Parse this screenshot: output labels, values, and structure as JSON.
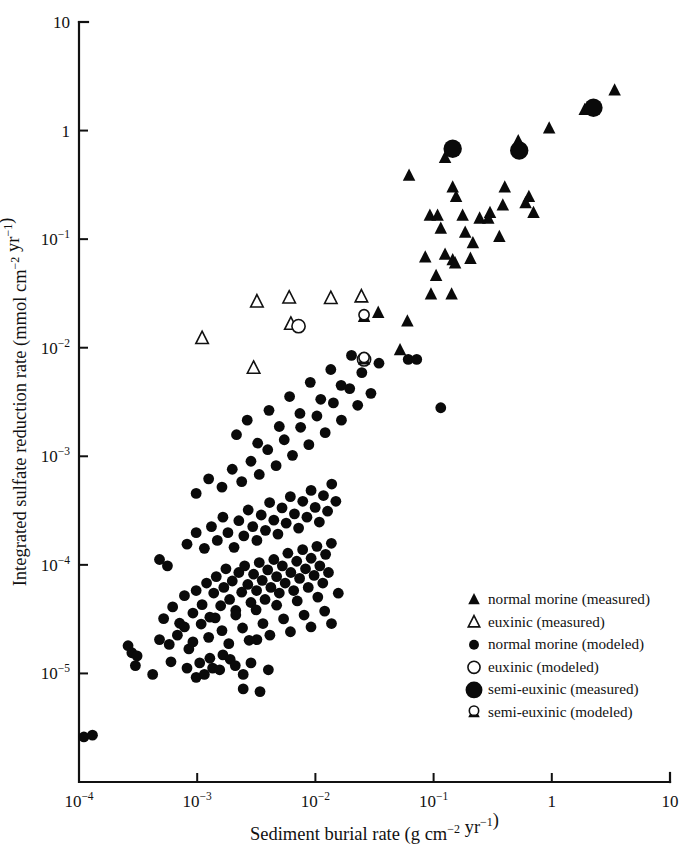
{
  "chart_data": {
    "type": "scatter",
    "title": "",
    "xlabel": "Sediment burial rate (g cm−2 yr−1)",
    "ylabel": "Integrated sulfate reduction rate (mmol cm−2 yr−1)",
    "xscale": "log",
    "yscale": "log",
    "xlim": [
      0.0001,
      10
    ],
    "ylim": [
      1e-06,
      10
    ],
    "grid": false,
    "legend_position": "inside-lower-right",
    "xticks": [
      {
        "value": 0.0001,
        "label": "10",
        "exp": "−4"
      },
      {
        "value": 0.001,
        "label": "10",
        "exp": "−3"
      },
      {
        "value": 0.01,
        "label": "10",
        "exp": "−2"
      },
      {
        "value": 0.1,
        "label": "10",
        "exp": "−1"
      },
      {
        "value": 1,
        "label": "1",
        "exp": ""
      },
      {
        "value": 10,
        "label": "10",
        "exp": ""
      }
    ],
    "yticks": [
      {
        "value": 10,
        "label": "10",
        "exp": ""
      },
      {
        "value": 1,
        "label": "1",
        "exp": ""
      },
      {
        "value": 0.1,
        "label": "10",
        "exp": "−1"
      },
      {
        "value": 0.01,
        "label": "10",
        "exp": "−2"
      },
      {
        "value": 0.001,
        "label": "10",
        "exp": "−3"
      },
      {
        "value": 0.0001,
        "label": "10",
        "exp": "−4"
      },
      {
        "value": 1e-05,
        "label": "10",
        "exp": "−5"
      }
    ],
    "series": [
      {
        "name": "normal morine (measured)",
        "marker": "filled-triangle",
        "color": "#0a0a0a",
        "points": [
          [
            0.062,
            0.385
          ],
          [
            0.125,
            0.56
          ],
          [
            0.145,
            0.3
          ],
          [
            0.155,
            0.245
          ],
          [
            0.093,
            0.165
          ],
          [
            0.108,
            0.165
          ],
          [
            0.115,
            0.125
          ],
          [
            0.176,
            0.165
          ],
          [
            0.185,
            0.115
          ],
          [
            0.215,
            0.092
          ],
          [
            0.3,
            0.175
          ],
          [
            0.36,
            0.105
          ],
          [
            0.385,
            0.205
          ],
          [
            0.4,
            0.3
          ],
          [
            0.52,
            0.8
          ],
          [
            0.6,
            0.215
          ],
          [
            0.64,
            0.245
          ],
          [
            0.7,
            0.175
          ],
          [
            0.95,
            1.05
          ],
          [
            1.9,
            1.55
          ],
          [
            3.4,
            2.35
          ],
          [
            0.085,
            0.068
          ],
          [
            0.105,
            0.046
          ],
          [
            0.145,
            0.064
          ],
          [
            0.152,
            0.06
          ],
          [
            0.205,
            0.066
          ],
          [
            0.095,
            0.031
          ],
          [
            0.142,
            0.031
          ],
          [
            0.06,
            0.0175
          ],
          [
            0.052,
            0.0095
          ],
          [
            0.034,
            0.021
          ],
          [
            0.125,
            0.072
          ],
          [
            0.245,
            0.155
          ],
          [
            0.29,
            0.155
          ]
        ]
      },
      {
        "name": "euxinic (measured)",
        "marker": "open-triangle",
        "color": "#ffffff",
        "points": [
          [
            0.0011,
            0.0122
          ],
          [
            0.003,
            0.0065
          ],
          [
            0.0032,
            0.0265
          ],
          [
            0.006,
            0.0288
          ],
          [
            0.0062,
            0.0165
          ],
          [
            0.0135,
            0.0285
          ],
          [
            0.0245,
            0.0295
          ]
        ]
      },
      {
        "name": "normal morine (modeled)",
        "marker": "filled-circle",
        "color": "#0a0a0a",
        "points": [
          [
            0.00011,
            2.6e-06
          ],
          [
            0.00013,
            2.7e-06
          ],
          [
            0.00026,
            1.8e-05
          ],
          [
            0.00028,
            1.55e-05
          ],
          [
            0.00031,
            1.45e-05
          ],
          [
            0.0003,
            1.18e-05
          ],
          [
            0.00048,
            2.05e-05
          ],
          [
            0.00042,
            9.8e-06
          ],
          [
            0.0006,
            1.28e-05
          ],
          [
            0.00085,
            1.68e-05
          ],
          [
            0.00082,
            1.12e-05
          ],
          [
            0.00105,
            1.25e-05
          ],
          [
            0.00098,
            9.2e-06
          ],
          [
            0.00115,
            9.8e-06
          ],
          [
            0.00128,
            1.38e-05
          ],
          [
            0.00135,
            1.12e-05
          ],
          [
            0.00155,
            1.08e-05
          ],
          [
            0.00165,
            1.48e-05
          ],
          [
            0.0019,
            1.35e-05
          ],
          [
            0.0021,
            1.18e-05
          ],
          [
            0.00245,
            9.8e-06
          ],
          [
            0.00285,
            1.25e-05
          ],
          [
            0.0032,
            2.05e-05
          ],
          [
            0.004,
            1.08e-05
          ],
          [
            0.00052,
            3.2e-05
          ],
          [
            0.00062,
            4.1e-05
          ],
          [
            0.00071,
            2.9e-05
          ],
          [
            0.00078,
            5.2e-05
          ],
          [
            0.00092,
            3.6e-05
          ],
          [
            0.00098,
            5.8e-05
          ],
          [
            0.0011,
            4.3e-05
          ],
          [
            0.0012,
            6.8e-05
          ],
          [
            0.00128,
            3.3e-05
          ],
          [
            0.00138,
            5.5e-05
          ],
          [
            0.00145,
            7.8e-05
          ],
          [
            0.00158,
            4.2e-05
          ],
          [
            0.00168,
            6.2e-05
          ],
          [
            0.00175,
            9.2e-05
          ],
          [
            0.00188,
            4.8e-05
          ],
          [
            0.00198,
            7.1e-05
          ],
          [
            0.00212,
            3.8e-05
          ],
          [
            0.00225,
            8.5e-05
          ],
          [
            0.00238,
            5.6e-05
          ],
          [
            0.00252,
            9.8e-05
          ],
          [
            0.00268,
            6.6e-05
          ],
          [
            0.00285,
            4.5e-05
          ],
          [
            0.003,
            8.2e-05
          ],
          [
            0.00318,
            5.8e-05
          ],
          [
            0.00335,
            0.000105
          ],
          [
            0.00355,
            7.2e-05
          ],
          [
            0.00375,
            4.8e-05
          ],
          [
            0.00395,
            9e-05
          ],
          [
            0.0042,
            6.2e-05
          ],
          [
            0.00445,
            0.000112
          ],
          [
            0.0047,
            7.8e-05
          ],
          [
            0.00495,
            5.5e-05
          ],
          [
            0.00525,
            9.8e-05
          ],
          [
            0.00555,
            6.8e-05
          ],
          [
            0.00585,
            0.000128
          ],
          [
            0.0062,
            8.5e-05
          ],
          [
            0.00655,
            5.8e-05
          ],
          [
            0.00695,
            0.000108
          ],
          [
            0.00735,
            7.5e-05
          ],
          [
            0.0078,
            0.000138
          ],
          [
            0.00825,
            9.2e-05
          ],
          [
            0.0087,
            6.2e-05
          ],
          [
            0.0092,
            0.000115
          ],
          [
            0.00975,
            8e-05
          ],
          [
            0.0103,
            0.000148
          ],
          [
            0.0109,
            9.8e-05
          ],
          [
            0.01155,
            6.8e-05
          ],
          [
            0.0122,
            0.000125
          ],
          [
            0.0129,
            8.5e-05
          ],
          [
            0.01365,
            0.000158
          ],
          [
            0.00048,
            0.000112
          ],
          [
            0.00056,
            9.8e-05
          ],
          [
            0.00082,
            0.000155
          ],
          [
            0.00098,
            0.000198
          ],
          [
            0.00115,
            0.000142
          ],
          [
            0.00132,
            0.000225
          ],
          [
            0.00148,
            0.000168
          ],
          [
            0.00165,
            0.000275
          ],
          [
            0.00182,
            0.000198
          ],
          [
            0.00205,
            0.000145
          ],
          [
            0.00225,
            0.000255
          ],
          [
            0.00248,
            0.000185
          ],
          [
            0.0027,
            0.00032
          ],
          [
            0.00295,
            0.000225
          ],
          [
            0.0032,
            0.000168
          ],
          [
            0.00348,
            0.000288
          ],
          [
            0.00378,
            0.000208
          ],
          [
            0.0041,
            0.000375
          ],
          [
            0.00445,
            0.000258
          ],
          [
            0.00482,
            0.000192
          ],
          [
            0.00522,
            0.000335
          ],
          [
            0.00566,
            0.000242
          ],
          [
            0.00614,
            0.000425
          ],
          [
            0.00665,
            0.000295
          ],
          [
            0.00721,
            0.000218
          ],
          [
            0.00782,
            0.000385
          ],
          [
            0.00848,
            0.000275
          ],
          [
            0.00919,
            0.000485
          ],
          [
            0.00996,
            0.000338
          ],
          [
            0.0108,
            0.000248
          ],
          [
            0.0117,
            0.000435
          ],
          [
            0.01268,
            0.000312
          ],
          [
            0.01375,
            0.000555
          ],
          [
            0.0149,
            0.000385
          ],
          [
            0.00098,
            0.000455
          ],
          [
            0.00125,
            0.00062
          ],
          [
            0.00162,
            0.00052
          ],
          [
            0.00198,
            0.00076
          ],
          [
            0.00238,
            0.000585
          ],
          [
            0.00285,
            0.0009
          ],
          [
            0.00335,
            0.00068
          ],
          [
            0.00395,
            0.00115
          ],
          [
            0.00465,
            0.00082
          ],
          [
            0.00545,
            0.00142
          ],
          [
            0.0064,
            0.00102
          ],
          [
            0.0075,
            0.00185
          ],
          [
            0.0088,
            0.00128
          ],
          [
            0.0103,
            0.00235
          ],
          [
            0.0121,
            0.00165
          ],
          [
            0.0142,
            0.0031
          ],
          [
            0.0166,
            0.00215
          ],
          [
            0.0195,
            0.0042
          ],
          [
            0.0228,
            0.00295
          ],
          [
            0.00215,
            0.00158
          ],
          [
            0.00265,
            0.00215
          ],
          [
            0.00325,
            0.00132
          ],
          [
            0.00405,
            0.00265
          ],
          [
            0.00495,
            0.00188
          ],
          [
            0.00605,
            0.00355
          ],
          [
            0.0074,
            0.00248
          ],
          [
            0.00905,
            0.0048
          ],
          [
            0.0111,
            0.00335
          ],
          [
            0.0135,
            0.0063
          ],
          [
            0.0165,
            0.0045
          ],
          [
            0.0202,
            0.0085
          ],
          [
            0.0247,
            0.0059
          ],
          [
            0.0295,
            0.0038
          ],
          [
            0.0345,
            0.0072
          ],
          [
            0.061,
            0.0078
          ],
          [
            0.072,
            0.0078
          ],
          [
            0.115,
            0.0028
          ],
          [
            0.0034,
            6.8e-06
          ],
          [
            0.00245,
            7.2e-06
          ],
          [
            0.00058,
            1.85e-05
          ],
          [
            0.00068,
            2.25e-05
          ],
          [
            0.00078,
            2.68e-05
          ],
          [
            0.00092,
            1.95e-05
          ],
          [
            0.00108,
            2.85e-05
          ],
          [
            0.00125,
            2.15e-05
          ],
          [
            0.00142,
            3.25e-05
          ],
          [
            0.00162,
            2.48e-05
          ],
          [
            0.00185,
            1.88e-05
          ],
          [
            0.00212,
            3.45e-05
          ],
          [
            0.00242,
            2.62e-05
          ],
          [
            0.00275,
            2.02e-05
          ],
          [
            0.00315,
            3.85e-05
          ],
          [
            0.0036,
            2.88e-05
          ],
          [
            0.00412,
            2.25e-05
          ],
          [
            0.0047,
            4.25e-05
          ],
          [
            0.00538,
            3.18e-05
          ],
          [
            0.00615,
            2.42e-05
          ],
          [
            0.00702,
            4.65e-05
          ],
          [
            0.00802,
            3.45e-05
          ],
          [
            0.00918,
            2.68e-05
          ],
          [
            0.01048,
            5.05e-05
          ],
          [
            0.01198,
            3.75e-05
          ],
          [
            0.01368,
            2.88e-05
          ],
          [
            0.01562,
            5.48e-05
          ]
        ]
      },
      {
        "name": "euxinic (modeled)",
        "marker": "open-circle",
        "color": "#ffffff",
        "points": [
          [
            0.0072,
            0.0158
          ],
          [
            0.0258,
            0.0078
          ]
        ]
      },
      {
        "name": "semi-euxinic (measured)",
        "marker": "large-filled-circle",
        "color": "#0a0a0a",
        "points": [
          [
            0.145,
            0.68
          ],
          [
            0.53,
            0.655
          ],
          [
            2.25,
            1.62
          ]
        ]
      },
      {
        "name": "semi-euxinic (modeled)",
        "marker": "semi-filled-triangle-circle",
        "color": "#0a0a0a",
        "points": [
          [
            0.0258,
            0.0193
          ],
          [
            0.0258,
            0.0078
          ]
        ]
      }
    ]
  },
  "legend": {
    "items": [
      {
        "marker": "filled-triangle",
        "label": "normal morine (measured)"
      },
      {
        "marker": "open-triangle",
        "label": "euxinic (measured)"
      },
      {
        "marker": "filled-circle",
        "label": "normal morine (modeled)"
      },
      {
        "marker": "open-circle",
        "label": "euxinic (modeled)"
      },
      {
        "marker": "large-filled-circle",
        "label": "semi-euxinic (measured)"
      },
      {
        "marker": "semi-filled-triangle-circle",
        "label": "semi-euxinic (modeled)"
      }
    ]
  }
}
